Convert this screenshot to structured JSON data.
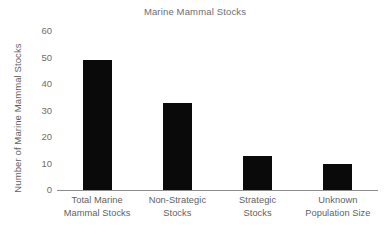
{
  "chart_data": {
    "type": "bar",
    "title": "Marine Mammal Stocks",
    "xlabel": "",
    "ylabel": "Number of Marine Mammal Stocks",
    "categories": [
      "Total Marine Mammal Stocks",
      "Non-Strategic Stocks",
      "Strategic Stocks",
      "Unknown Population Size"
    ],
    "category_lines": [
      [
        "Total Marine",
        "Mammal Stocks"
      ],
      [
        "Non-Strategic",
        "Stocks"
      ],
      [
        "Strategic",
        "Stocks"
      ],
      [
        "Unknown",
        "Population Size"
      ]
    ],
    "values": [
      49,
      33,
      13,
      10
    ],
    "ylim": [
      0,
      62
    ],
    "yticks": [
      0,
      10,
      20,
      30,
      40,
      50,
      60
    ],
    "ytick_labels": [
      "0",
      "10",
      "20",
      "30",
      "40",
      "50",
      "60"
    ],
    "grid": false,
    "legend": false,
    "bar_color": "#0a0a0a",
    "text_color": "#5f6060",
    "axis_color": "#8c8c8c",
    "background": "#ffffff"
  }
}
